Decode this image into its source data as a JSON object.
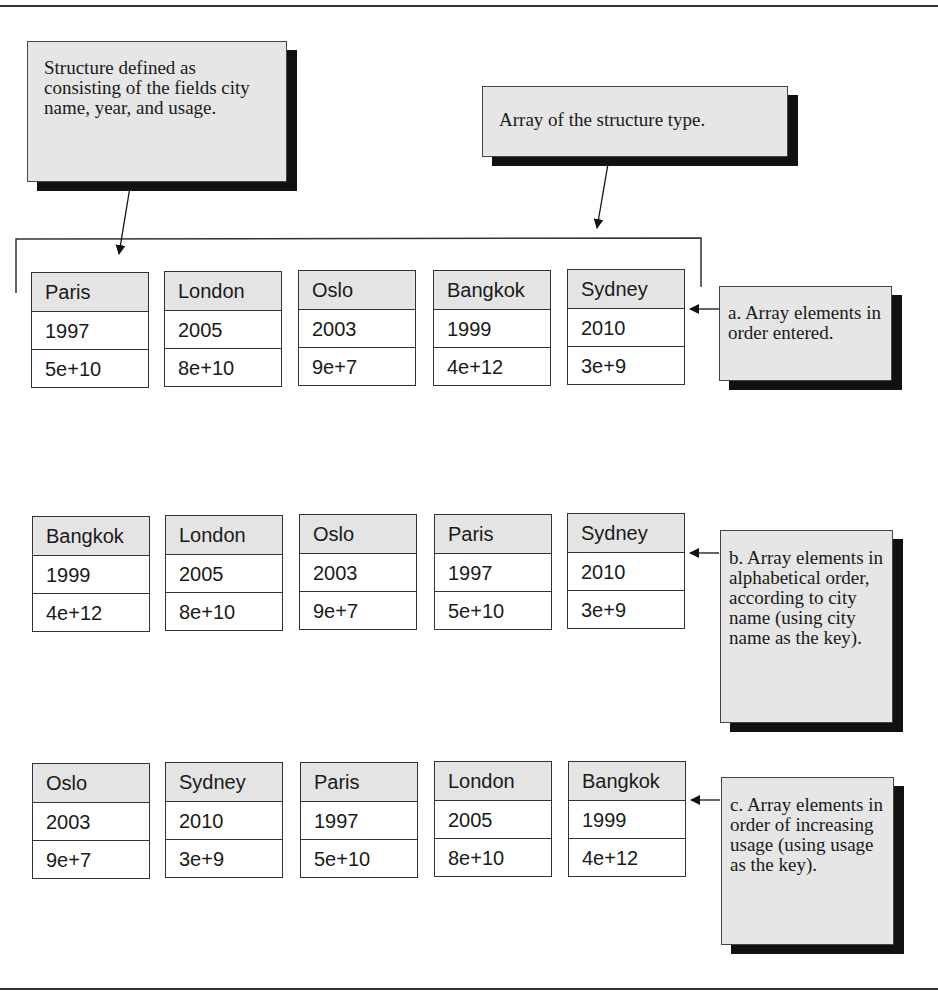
{
  "callouts": {
    "structure": "Structure defined as consisting of the fields city name, year, and usage.",
    "array": "Array of the structure type.",
    "a": "a. Array elements in order entered.",
    "b": "b. Array elements in alphabetical order, according to city name (using city name as the key).",
    "c": "c. Array elements in order of increasing usage (using usage as the key)."
  },
  "arrays": {
    "a": [
      {
        "city": "Paris",
        "year": "1997",
        "usage": "5e+10"
      },
      {
        "city": "London",
        "year": "2005",
        "usage": "8e+10"
      },
      {
        "city": "Oslo",
        "year": "2003",
        "usage": "9e+7"
      },
      {
        "city": "Bangkok",
        "year": "1999",
        "usage": "4e+12"
      },
      {
        "city": "Sydney",
        "year": "2010",
        "usage": "3e+9"
      }
    ],
    "b": [
      {
        "city": "Bangkok",
        "year": "1999",
        "usage": "4e+12"
      },
      {
        "city": "London",
        "year": "2005",
        "usage": "8e+10"
      },
      {
        "city": "Oslo",
        "year": "2003",
        "usage": "9e+7"
      },
      {
        "city": "Paris",
        "year": "1997",
        "usage": "5e+10"
      },
      {
        "city": "Sydney",
        "year": "2010",
        "usage": "3e+9"
      }
    ],
    "c": [
      {
        "city": "Oslo",
        "year": "2003",
        "usage": "9e+7"
      },
      {
        "city": "Sydney",
        "year": "2010",
        "usage": "3e+9"
      },
      {
        "city": "Paris",
        "year": "1997",
        "usage": "5e+10"
      },
      {
        "city": "London",
        "year": "2005",
        "usage": "8e+10"
      },
      {
        "city": "Bangkok",
        "year": "1999",
        "usage": "4e+12"
      }
    ]
  },
  "colors": {
    "callout_bg": "#e6e6e6",
    "header_bg": "#e4e4e4",
    "shadow": "#111111",
    "line": "#333333"
  }
}
